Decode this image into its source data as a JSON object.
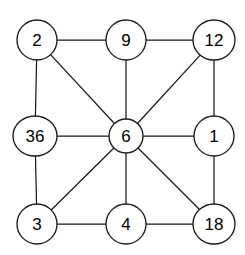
{
  "figure": {
    "name": "undirected-graph",
    "background_color": "#ffffff",
    "stroke_color": "#1a1a1a",
    "label_color": "#000000"
  },
  "graph": {
    "node_radius": 20,
    "center_node_radius": 17,
    "nodes": [
      {
        "id": "n2",
        "label": "2",
        "cx": 37,
        "cy": 40,
        "rx": 20,
        "ry": 20,
        "position": "top-left"
      },
      {
        "id": "n9",
        "label": "9",
        "cx": 126,
        "cy": 40,
        "rx": 20,
        "ry": 20,
        "position": "top-center"
      },
      {
        "id": "n12",
        "label": "12",
        "cx": 214,
        "cy": 40,
        "rx": 21,
        "ry": 20,
        "position": "top-right"
      },
      {
        "id": "n36",
        "label": "36",
        "cx": 35,
        "cy": 136,
        "rx": 22,
        "ry": 20,
        "position": "middle-left"
      },
      {
        "id": "n6",
        "label": "6",
        "cx": 126,
        "cy": 136,
        "rx": 17,
        "ry": 17,
        "position": "center"
      },
      {
        "id": "n1",
        "label": "1",
        "cx": 214,
        "cy": 136,
        "rx": 20,
        "ry": 20,
        "position": "middle-right"
      },
      {
        "id": "n3",
        "label": "3",
        "cx": 37,
        "cy": 224,
        "rx": 20,
        "ry": 20,
        "position": "bottom-left"
      },
      {
        "id": "n4",
        "label": "4",
        "cx": 126,
        "cy": 224,
        "rx": 20,
        "ry": 20,
        "position": "bottom-center"
      },
      {
        "id": "n18",
        "label": "18",
        "cx": 214,
        "cy": 224,
        "rx": 21,
        "ry": 20,
        "position": "bottom-right"
      }
    ],
    "edges": [
      {
        "from": "n2",
        "to": "n9",
        "kind": "horizontal"
      },
      {
        "from": "n9",
        "to": "n12",
        "kind": "horizontal"
      },
      {
        "from": "n36",
        "to": "n6",
        "kind": "horizontal"
      },
      {
        "from": "n6",
        "to": "n1",
        "kind": "horizontal"
      },
      {
        "from": "n3",
        "to": "n4",
        "kind": "horizontal"
      },
      {
        "from": "n4",
        "to": "n18",
        "kind": "horizontal"
      },
      {
        "from": "n2",
        "to": "n36",
        "kind": "vertical"
      },
      {
        "from": "n36",
        "to": "n3",
        "kind": "vertical"
      },
      {
        "from": "n9",
        "to": "n6",
        "kind": "vertical"
      },
      {
        "from": "n6",
        "to": "n4",
        "kind": "vertical"
      },
      {
        "from": "n12",
        "to": "n1",
        "kind": "vertical"
      },
      {
        "from": "n1",
        "to": "n18",
        "kind": "vertical"
      },
      {
        "from": "n2",
        "to": "n6",
        "kind": "diagonal"
      },
      {
        "from": "n12",
        "to": "n6",
        "kind": "diagonal"
      },
      {
        "from": "n3",
        "to": "n6",
        "kind": "diagonal"
      },
      {
        "from": "n18",
        "to": "n6",
        "kind": "diagonal"
      }
    ]
  }
}
